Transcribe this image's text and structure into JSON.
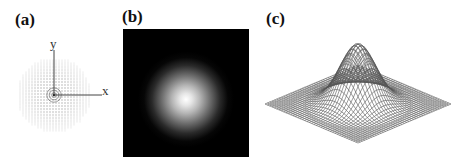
{
  "figure": {
    "panels": [
      {
        "id": "a",
        "label": "(a)",
        "description": "Vector field of gradient magnitudes sampled on a grid, centered at origin",
        "axes": {
          "x_label": "x",
          "y_label": "y"
        }
      },
      {
        "id": "b",
        "label": "(b)",
        "description": "Grayscale image of a 2D Gaussian blob on black background"
      },
      {
        "id": "c",
        "label": "(c)",
        "description": "3D wireframe surface plot of a 2D Gaussian"
      }
    ]
  },
  "colors": {
    "background": "#ffffff",
    "ink": "#111111",
    "grid_dot": "#9a9a9a",
    "wire": "#555555",
    "image_bg": "#000000"
  }
}
